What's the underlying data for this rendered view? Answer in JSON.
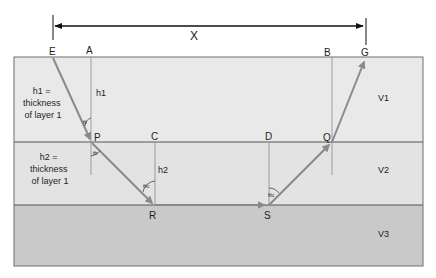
{
  "diagram": {
    "distance_label": "X",
    "points": {
      "E": "E",
      "A": "A",
      "B": "B",
      "G": "G",
      "P": "P",
      "C": "C",
      "D": "D",
      "Q": "Q",
      "R": "R",
      "S": "S"
    },
    "layers": [
      {
        "name": "layer-1",
        "velocity": "V1",
        "color": "#e9e9e9"
      },
      {
        "name": "layer-2",
        "velocity": "V2",
        "color": "#e3e3e3"
      },
      {
        "name": "layer-3",
        "velocity": "V3",
        "color": "#c9c9c9"
      }
    ],
    "thickness_notes": {
      "layer1_line1": "h1 =",
      "layer1_line2": "thickness",
      "layer1_line3": "of layer 1",
      "layer2_line1": "h2 =",
      "layer2_line2": "thickness",
      "layer2_line3": "of layer 1"
    },
    "heights": {
      "h1": "h1",
      "h2": "h2"
    },
    "angles": {
      "incident": "θi",
      "refracted": "θr",
      "critical_R": "θic",
      "critical_S": "θic"
    },
    "colors": {
      "ray": "#8a8a8a",
      "border": "#6e6e6e",
      "text": "#1e1e1e"
    }
  }
}
